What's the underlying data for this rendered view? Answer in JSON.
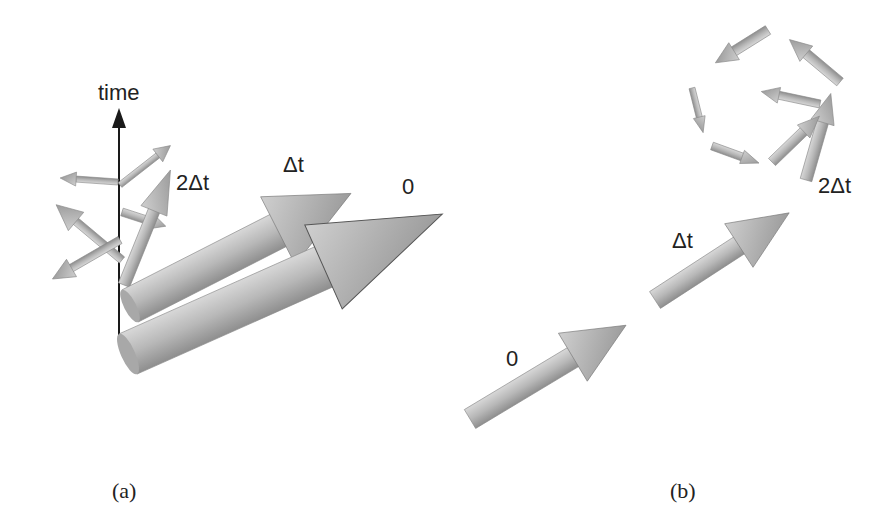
{
  "panel_a": {
    "axis_label": "time",
    "labels": {
      "t0": "0",
      "t1": "Δt",
      "t2": "2Δt"
    },
    "caption": "(a)"
  },
  "panel_b": {
    "labels": {
      "t0": "0",
      "t1": "Δt",
      "t2": "2Δt"
    },
    "caption": "(b)"
  },
  "colors": {
    "arrow": "#b4b4b4",
    "arrow_dark": "#8a8a8a",
    "axis": "#1a1a1a",
    "background": "#ffffff"
  }
}
